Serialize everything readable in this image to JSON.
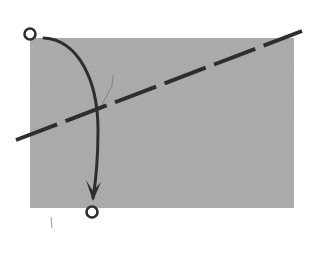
{
  "canvas": {
    "width": 318,
    "height": 255,
    "background": "#ffffff"
  },
  "colors": {
    "region_fill": "#a9a9a9",
    "stroke": "#2e2e2e",
    "faint_mark": "#7a7a7a"
  },
  "region": {
    "x": 30,
    "y": 38,
    "width": 264,
    "height": 170
  },
  "axis_line": {
    "style": "dashed",
    "x1": 16,
    "y1": 140,
    "x2": 302,
    "y2": 31,
    "dash_pattern": "44 9",
    "stroke_width": 4
  },
  "start_point": {
    "cx": 30,
    "cy": 34,
    "r": 5.5,
    "label": ""
  },
  "end_point": {
    "cx": 92,
    "cy": 212,
    "r": 5.5,
    "label": ""
  },
  "arc_arrow": {
    "path": "M 44 38 C 78 40, 98 80, 98 130 C 98 160, 96 180, 93 198",
    "stroke_width": 3,
    "arrowhead": {
      "tip": [
        93,
        201
      ],
      "left": [
        86,
        180
      ],
      "right": [
        101,
        182
      ]
    }
  },
  "faint_marks": [
    {
      "x1": 99,
      "y1": 110,
      "x2": 112,
      "y2": 86
    },
    {
      "x1": 112,
      "y1": 86,
      "x2": 113,
      "y2": 75
    },
    {
      "x1": 51,
      "y1": 217,
      "x2": 52,
      "y2": 228
    }
  ]
}
